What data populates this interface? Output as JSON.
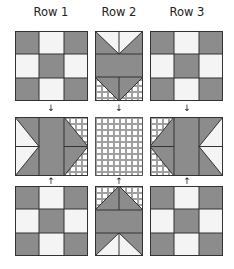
{
  "headers": [
    "Row 1",
    "Row 2",
    "Row 3"
  ],
  "colors": {
    "gray": "#8c8c8c",
    "white": "#f4f4f4",
    "line": "#333333",
    "check_bg": "#ffffff",
    "check_line": "#9a9a9a"
  },
  "arrows": {
    "down": "↓",
    "up": "↑"
  },
  "blocks": [
    {
      "id": "r1-top",
      "type": "nine-patch"
    },
    {
      "id": "r2-top",
      "type": "goose-down"
    },
    {
      "id": "r3-top",
      "type": "nine-patch"
    },
    {
      "id": "r1-mid",
      "type": "goose-right"
    },
    {
      "id": "r2-mid",
      "type": "checkered"
    },
    {
      "id": "r3-mid",
      "type": "goose-left"
    },
    {
      "id": "r1-bot",
      "type": "nine-patch"
    },
    {
      "id": "r2-bot",
      "type": "goose-up"
    },
    {
      "id": "r3-bot",
      "type": "nine-patch"
    }
  ]
}
